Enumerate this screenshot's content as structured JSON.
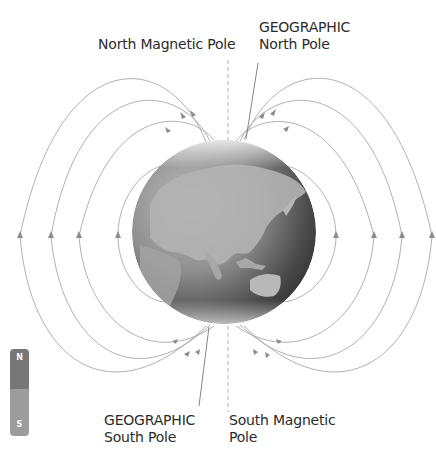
{
  "labels": {
    "north_magnetic_pole": "North Magnetic Pole",
    "geographic_north_line1": "GEOGRAPHIC",
    "geographic_north_line2": "North Pole",
    "geographic_south_line1": "GEOGRAPHIC",
    "geographic_south_line2": "South Pole",
    "south_magnetic_line1": "South Magnetic",
    "south_magnetic_line2": "Pole"
  },
  "magnet": {
    "north_label": "N",
    "south_label": "S",
    "north_color": "#777777",
    "south_color": "#9c9c9c"
  },
  "globe": {
    "center_x": 224,
    "center_y": 232,
    "radius": 92
  },
  "colors": {
    "field_line": "#a8a8a8",
    "arrow": "#8c8c8c",
    "label_text": "#2b2b2b"
  }
}
